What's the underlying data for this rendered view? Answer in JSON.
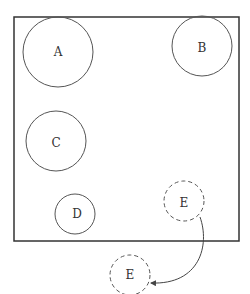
{
  "diagram": {
    "frame": {
      "x": 14,
      "y": 17,
      "width": 225,
      "height": 224
    },
    "circles": [
      {
        "label": "A",
        "cx": 58,
        "cy": 52,
        "r": 35,
        "style": "solid"
      },
      {
        "label": "B",
        "cx": 202,
        "cy": 46,
        "r": 30,
        "style": "solid"
      },
      {
        "label": "C",
        "cx": 56,
        "cy": 141,
        "r": 30,
        "style": "solid"
      },
      {
        "label": "D",
        "cx": 75,
        "cy": 214,
        "r": 20,
        "style": "solid"
      },
      {
        "label": "E",
        "cx": 184,
        "cy": 201,
        "r": 20,
        "style": "dashed"
      },
      {
        "label": "E",
        "cx": 130,
        "cy": 275,
        "r": 20,
        "style": "dashed"
      }
    ],
    "arrow": {
      "from": "E (inside)",
      "to": "E (outside)"
    }
  }
}
